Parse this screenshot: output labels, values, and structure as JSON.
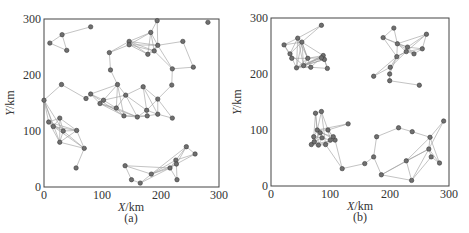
{
  "chart_data": [
    {
      "type": "scatter",
      "subtype": "network-graph",
      "panel_label": "(a)",
      "xlabel": "X/km",
      "ylabel": "Y/km",
      "xlim": [
        0,
        300
      ],
      "ylim": [
        0,
        300
      ],
      "xticks": [
        0,
        100,
        200,
        300
      ],
      "yticks": [
        0,
        100,
        200,
        300
      ],
      "grid": false,
      "nodes": [
        [
          10,
          257
        ],
        [
          31,
          272
        ],
        [
          39,
          244
        ],
        [
          80,
          286
        ],
        [
          281,
          294
        ],
        [
          194,
          297
        ],
        [
          183,
          276
        ],
        [
          146,
          260
        ],
        [
          146,
          254
        ],
        [
          178,
          237
        ],
        [
          189,
          243
        ],
        [
          195,
          253
        ],
        [
          238,
          260
        ],
        [
          112,
          240
        ],
        [
          220,
          211
        ],
        [
          256,
          214
        ],
        [
          114,
          209
        ],
        [
          219,
          182
        ],
        [
          30,
          183
        ],
        [
          0,
          155
        ],
        [
          72,
          158
        ],
        [
          80,
          166
        ],
        [
          96,
          149
        ],
        [
          102,
          155
        ],
        [
          126,
          183
        ],
        [
          124,
          141
        ],
        [
          140,
          164
        ],
        [
          137,
          127
        ],
        [
          160,
          125
        ],
        [
          170,
          179
        ],
        [
          177,
          127
        ],
        [
          176,
          137
        ],
        [
          195,
          157
        ],
        [
          195,
          130
        ],
        [
          220,
          123
        ],
        [
          8,
          116
        ],
        [
          16,
          108
        ],
        [
          27,
          123
        ],
        [
          27,
          80
        ],
        [
          33,
          100
        ],
        [
          56,
          101
        ],
        [
          69,
          69
        ],
        [
          55,
          34
        ],
        [
          139,
          38
        ],
        [
          150,
          13
        ],
        [
          165,
          7
        ],
        [
          184,
          23
        ],
        [
          216,
          34
        ],
        [
          226,
          48
        ],
        [
          227,
          41
        ],
        [
          244,
          72
        ],
        [
          228,
          13
        ],
        [
          259,
          59
        ]
      ],
      "edges": [
        [
          0,
          1
        ],
        [
          1,
          2
        ],
        [
          0,
          2
        ],
        [
          1,
          3
        ],
        [
          5,
          6
        ],
        [
          5,
          11
        ],
        [
          6,
          7
        ],
        [
          6,
          8
        ],
        [
          6,
          9
        ],
        [
          6,
          10
        ],
        [
          6,
          11
        ],
        [
          7,
          8
        ],
        [
          7,
          9
        ],
        [
          7,
          10
        ],
        [
          7,
          11
        ],
        [
          8,
          9
        ],
        [
          8,
          10
        ],
        [
          8,
          11
        ],
        [
          9,
          10
        ],
        [
          9,
          11
        ],
        [
          10,
          11
        ],
        [
          11,
          12
        ],
        [
          12,
          15
        ],
        [
          15,
          14
        ],
        [
          11,
          14
        ],
        [
          10,
          14
        ],
        [
          7,
          13
        ],
        [
          8,
          13
        ],
        [
          13,
          16
        ],
        [
          16,
          24
        ],
        [
          14,
          17
        ],
        [
          17,
          32
        ],
        [
          18,
          19
        ],
        [
          18,
          20
        ],
        [
          19,
          35
        ],
        [
          19,
          36
        ],
        [
          19,
          38
        ],
        [
          19,
          39
        ],
        [
          21,
          24
        ],
        [
          21,
          22
        ],
        [
          21,
          23
        ],
        [
          21,
          27
        ],
        [
          22,
          23
        ],
        [
          22,
          25
        ],
        [
          22,
          27
        ],
        [
          23,
          24
        ],
        [
          23,
          25
        ],
        [
          23,
          26
        ],
        [
          24,
          26
        ],
        [
          24,
          25
        ],
        [
          24,
          27
        ],
        [
          25,
          26
        ],
        [
          25,
          27
        ],
        [
          26,
          28
        ],
        [
          26,
          29
        ],
        [
          26,
          31
        ],
        [
          27,
          28
        ],
        [
          27,
          30
        ],
        [
          28,
          30
        ],
        [
          28,
          31
        ],
        [
          29,
          31
        ],
        [
          29,
          32
        ],
        [
          30,
          31
        ],
        [
          30,
          33
        ],
        [
          31,
          32
        ],
        [
          31,
          33
        ],
        [
          32,
          33
        ],
        [
          32,
          34
        ],
        [
          33,
          34
        ],
        [
          29,
          33
        ],
        [
          22,
          28
        ],
        [
          20,
          21
        ],
        [
          25,
          28
        ],
        [
          35,
          36
        ],
        [
          35,
          37
        ],
        [
          35,
          38
        ],
        [
          35,
          39
        ],
        [
          35,
          40
        ],
        [
          36,
          37
        ],
        [
          36,
          39
        ],
        [
          36,
          40
        ],
        [
          37,
          39
        ],
        [
          37,
          40
        ],
        [
          38,
          39
        ],
        [
          38,
          40
        ],
        [
          38,
          41
        ],
        [
          39,
          40
        ],
        [
          39,
          41
        ],
        [
          40,
          41
        ],
        [
          41,
          42
        ],
        [
          37,
          38
        ],
        [
          36,
          41
        ],
        [
          43,
          44
        ],
        [
          43,
          46
        ],
        [
          44,
          45
        ],
        [
          45,
          46
        ],
        [
          46,
          47
        ],
        [
          46,
          48
        ],
        [
          46,
          49
        ],
        [
          47,
          48
        ],
        [
          47,
          49
        ],
        [
          47,
          51
        ],
        [
          48,
          49
        ],
        [
          48,
          50
        ],
        [
          49,
          50
        ],
        [
          49,
          51
        ],
        [
          49,
          52
        ],
        [
          50,
          52
        ],
        [
          48,
          52
        ],
        [
          46,
          50
        ],
        [
          43,
          47
        ],
        [
          45,
          47
        ]
      ]
    },
    {
      "type": "scatter",
      "subtype": "network-graph",
      "panel_label": "(b)",
      "xlabel": "X/km",
      "ylabel": "Y/km",
      "xlim": [
        0,
        300
      ],
      "ylim": [
        0,
        300
      ],
      "xticks": [
        0,
        100,
        200,
        300
      ],
      "yticks": [
        0,
        100,
        200,
        300
      ],
      "grid": false,
      "nodes": [
        [
          22,
          252
        ],
        [
          45,
          264
        ],
        [
          52,
          257
        ],
        [
          85,
          287
        ],
        [
          32,
          236
        ],
        [
          43,
          211
        ],
        [
          55,
          215
        ],
        [
          67,
          212
        ],
        [
          88,
          233
        ],
        [
          90,
          226
        ],
        [
          95,
          210
        ],
        [
          85,
          229
        ],
        [
          35,
          228
        ],
        [
          62,
          228
        ],
        [
          207,
          282
        ],
        [
          189,
          265
        ],
        [
          213,
          254
        ],
        [
          262,
          271
        ],
        [
          228,
          240
        ],
        [
          241,
          236
        ],
        [
          255,
          245
        ],
        [
          212,
          231
        ],
        [
          201,
          212
        ],
        [
          200,
          200
        ],
        [
          200,
          188
        ],
        [
          173,
          196
        ],
        [
          250,
          180
        ],
        [
          230,
          248
        ],
        [
          75,
          130
        ],
        [
          85,
          133
        ],
        [
          78,
          100
        ],
        [
          72,
          88
        ],
        [
          68,
          74
        ],
        [
          80,
          73
        ],
        [
          92,
          74
        ],
        [
          96,
          100
        ],
        [
          108,
          82
        ],
        [
          130,
          111
        ],
        [
          73,
          79
        ],
        [
          86,
          86
        ],
        [
          100,
          82
        ],
        [
          83,
          95
        ],
        [
          105,
          88
        ],
        [
          120,
          31
        ],
        [
          158,
          40
        ],
        [
          173,
          52
        ],
        [
          178,
          88
        ],
        [
          215,
          104
        ],
        [
          238,
          97
        ],
        [
          186,
          20
        ],
        [
          228,
          45
        ],
        [
          237,
          10
        ],
        [
          268,
          87
        ],
        [
          291,
          116
        ],
        [
          266,
          66
        ],
        [
          270,
          52
        ],
        [
          284,
          41
        ]
      ],
      "edges": [
        [
          0,
          1
        ],
        [
          0,
          2
        ],
        [
          0,
          4
        ],
        [
          0,
          12
        ],
        [
          1,
          2
        ],
        [
          1,
          3
        ],
        [
          1,
          4
        ],
        [
          1,
          5
        ],
        [
          1,
          6
        ],
        [
          1,
          13
        ],
        [
          2,
          4
        ],
        [
          2,
          5
        ],
        [
          2,
          6
        ],
        [
          2,
          7
        ],
        [
          2,
          8
        ],
        [
          2,
          13
        ],
        [
          3,
          2
        ],
        [
          4,
          5
        ],
        [
          4,
          6
        ],
        [
          4,
          12
        ],
        [
          5,
          6
        ],
        [
          5,
          7
        ],
        [
          5,
          8
        ],
        [
          5,
          9
        ],
        [
          5,
          11
        ],
        [
          6,
          7
        ],
        [
          6,
          8
        ],
        [
          6,
          9
        ],
        [
          6,
          11
        ],
        [
          6,
          13
        ],
        [
          7,
          8
        ],
        [
          7,
          10
        ],
        [
          8,
          9
        ],
        [
          8,
          10
        ],
        [
          9,
          10
        ],
        [
          9,
          11
        ],
        [
          11,
          13
        ],
        [
          12,
          13
        ],
        [
          13,
          5
        ],
        [
          13,
          8
        ],
        [
          14,
          15
        ],
        [
          14,
          16
        ],
        [
          15,
          16
        ],
        [
          15,
          21
        ],
        [
          16,
          17
        ],
        [
          16,
          18
        ],
        [
          16,
          19
        ],
        [
          16,
          27
        ],
        [
          17,
          18
        ],
        [
          17,
          20
        ],
        [
          17,
          27
        ],
        [
          18,
          19
        ],
        [
          18,
          20
        ],
        [
          18,
          21
        ],
        [
          19,
          20
        ],
        [
          19,
          27
        ],
        [
          20,
          27
        ],
        [
          21,
          22
        ],
        [
          21,
          18
        ],
        [
          21,
          16
        ],
        [
          22,
          23
        ],
        [
          22,
          25
        ],
        [
          22,
          18
        ],
        [
          23,
          24
        ],
        [
          24,
          26
        ],
        [
          25,
          21
        ],
        [
          23,
          21
        ],
        [
          15,
          27
        ],
        [
          28,
          29
        ],
        [
          28,
          30
        ],
        [
          28,
          31
        ],
        [
          28,
          33
        ],
        [
          29,
          30
        ],
        [
          29,
          35
        ],
        [
          29,
          34
        ],
        [
          30,
          31
        ],
        [
          30,
          35
        ],
        [
          30,
          36
        ],
        [
          30,
          37
        ],
        [
          31,
          32
        ],
        [
          31,
          33
        ],
        [
          31,
          38
        ],
        [
          32,
          33
        ],
        [
          32,
          38
        ],
        [
          33,
          34
        ],
        [
          33,
          39
        ],
        [
          34,
          36
        ],
        [
          34,
          40
        ],
        [
          35,
          36
        ],
        [
          35,
          37
        ],
        [
          35,
          40
        ],
        [
          36,
          42
        ],
        [
          36,
          43
        ],
        [
          34,
          43
        ],
        [
          38,
          39
        ],
        [
          38,
          41
        ],
        [
          39,
          40
        ],
        [
          39,
          41
        ],
        [
          40,
          42
        ],
        [
          41,
          42
        ],
        [
          41,
          30
        ],
        [
          42,
          35
        ],
        [
          32,
          36
        ],
        [
          33,
          40
        ],
        [
          31,
          39
        ],
        [
          43,
          44
        ],
        [
          44,
          45
        ],
        [
          45,
          46
        ],
        [
          45,
          49
        ],
        [
          46,
          47
        ],
        [
          47,
          48
        ],
        [
          48,
          52
        ],
        [
          49,
          50
        ],
        [
          49,
          51
        ],
        [
          50,
          51
        ],
        [
          50,
          52
        ],
        [
          50,
          54
        ],
        [
          49,
          54
        ],
        [
          51,
          55
        ],
        [
          52,
          53
        ],
        [
          52,
          54
        ],
        [
          52,
          56
        ],
        [
          53,
          54
        ],
        [
          54,
          55
        ],
        [
          55,
          56
        ],
        [
          54,
          56
        ],
        [
          51,
          54
        ]
      ]
    }
  ],
  "panels": {
    "a": {
      "label": "(a)",
      "xlabel_var": "X",
      "xlabel_unit": "/km",
      "ylabel_var": "Y",
      "ylabel_unit": "/km",
      "xtick_labels": [
        "0",
        "100",
        "200",
        "300"
      ],
      "ytick_labels": [
        "0",
        "100",
        "200",
        "300"
      ]
    },
    "b": {
      "label": "(b)",
      "xlabel_var": "X",
      "xlabel_unit": "/km",
      "ylabel_var": "Y",
      "ylabel_unit": "/km",
      "xtick_labels": [
        "0",
        "100",
        "200",
        "300"
      ],
      "ytick_labels": [
        "0",
        "100",
        "200",
        "300"
      ]
    }
  },
  "style": {
    "node_fill": "#6f6f6f",
    "node_stroke": "#3a3a3a",
    "edge_color": "#9a9a9a",
    "frame_color": "#444444"
  }
}
